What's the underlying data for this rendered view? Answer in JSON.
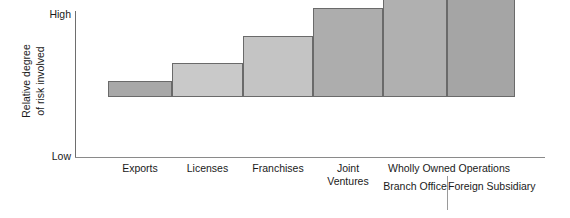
{
  "chart_data": {
    "type": "bar",
    "title": "",
    "subtitle": "",
    "xlabel": "",
    "ylabel": "Relative degree of risk involved",
    "ylabel_lines": [
      "Relative degree",
      "of risk involved"
    ],
    "ytick_labels": [
      "High",
      "Low"
    ],
    "ylim": [
      0,
      100
    ],
    "grid": false,
    "legend": null,
    "categories": [
      "Exports",
      "Licenses",
      "Franchises",
      "Joint Ventures",
      "Branch Office",
      "Foreign Subsidiary"
    ],
    "values": [
      11,
      24,
      43,
      62,
      81,
      98
    ],
    "bar_colors": [
      "#a8a8a8",
      "#c9c9c9",
      "#c4c4c4",
      "#adadad",
      "#b0b0b0",
      "#a5a5a5"
    ],
    "annotations": [
      {
        "text": "Wholly Owned Operations",
        "spans_categories": [
          "Branch Office",
          "Foreign Subsidiary"
        ]
      }
    ]
  },
  "axis": {
    "y_title_line1": "Relative degree",
    "y_title_line2": "of risk involved",
    "tick_high": "High",
    "tick_low": "Low"
  },
  "bars": [
    {
      "label": "Exports",
      "label_line2": ""
    },
    {
      "label": "Licenses",
      "label_line2": ""
    },
    {
      "label": "Franchises",
      "label_line2": ""
    },
    {
      "label": "Joint",
      "label_line2": "Ventures"
    },
    {
      "label": "Branch",
      "label_line2": "Office"
    },
    {
      "label": "Foreign",
      "label_line2": "Subsidiary"
    }
  ],
  "group": {
    "heading": "Wholly Owned Operations"
  }
}
